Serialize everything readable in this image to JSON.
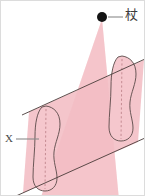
{
  "figure": {
    "canvas": {
      "width": 145,
      "height": 196,
      "background": "#ffffff"
    },
    "border": {
      "show": true,
      "color": "#d8d8d8"
    },
    "colors": {
      "fill_pink": "#f4c3c9",
      "fill_pink_light": "#f7ced3",
      "outline": "#5a4a48",
      "dashed": "#c98f96",
      "label_text": "#4a4a4a",
      "apex_dot": "#1a1a1a",
      "leader_line": "#7a7a7a"
    },
    "labels": [
      {
        "id": "apex-label",
        "text": "杖",
        "meaning": "staff-cane-kanji",
        "x": 125,
        "y": 8
      },
      {
        "id": "x-label",
        "text": "X",
        "meaning": "region-label-x",
        "x": 5,
        "y": 133
      }
    ],
    "apex_point": {
      "x": 102,
      "y": 17,
      "radius": 5
    },
    "leader_lines": [
      {
        "id": "apex-leader",
        "x1": 108,
        "y1": 17,
        "x2": 123,
        "y2": 17
      },
      {
        "id": "x-leader",
        "x1": 16,
        "y1": 139,
        "x2": 38,
        "y2": 139
      }
    ],
    "cone": {
      "description": "light-cone projected from apex point downward",
      "apex": {
        "x": 102,
        "y": 19
      },
      "base_left": {
        "x": 40,
        "y": 196
      },
      "base_right": {
        "x": 117,
        "y": 196
      }
    },
    "parallelogram": {
      "description": "slanted band plane",
      "points": [
        {
          "x": 29,
          "y": 112
        },
        {
          "x": 144,
          "y": 60
        },
        {
          "x": 138,
          "y": 142
        },
        {
          "x": 23,
          "y": 193
        }
      ],
      "edge_extension": 10
    },
    "footprints": [
      {
        "id": "footprint-left",
        "label": "X",
        "center_x": 46,
        "top_y": 106,
        "bottom_y": 190,
        "width": 30,
        "has_dashed_axis": true
      },
      {
        "id": "footprint-right",
        "label": "",
        "center_x": 122,
        "top_y": 56,
        "bottom_y": 140,
        "width": 30,
        "has_dashed_axis": true
      }
    ]
  }
}
